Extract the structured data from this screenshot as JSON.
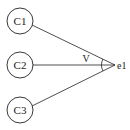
{
  "diagram": {
    "nodes": [
      {
        "id": "C1",
        "label": "C1"
      },
      {
        "id": "C2",
        "label": "C2"
      },
      {
        "id": "C3",
        "label": "C3"
      }
    ],
    "target": {
      "label": "e1"
    },
    "angle_label": "V",
    "edges": [
      {
        "from": "C1",
        "to": "e1"
      },
      {
        "from": "C2",
        "to": "e1"
      },
      {
        "from": "C3",
        "to": "e1"
      }
    ],
    "colors": {
      "stroke": "#222222",
      "background": "#ffffff"
    }
  }
}
